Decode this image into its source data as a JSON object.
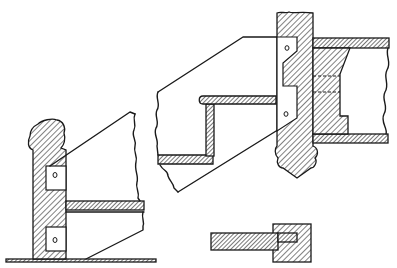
{
  "figure": {
    "type": "technical-line-drawing",
    "ink_color": "#1a1a1a",
    "background": "#ffffff"
  },
  "views": [
    {
      "id": "post-elevation",
      "description": "Turned newel post on floor with two bracket plates and a horizontal tread section"
    },
    {
      "id": "stair-step-detail",
      "description": "Stair step profile (tread and riser) fixed to post with notched bracket plate"
    },
    {
      "id": "joint-section",
      "description": "Section of tread tongue housed in square post"
    }
  ]
}
